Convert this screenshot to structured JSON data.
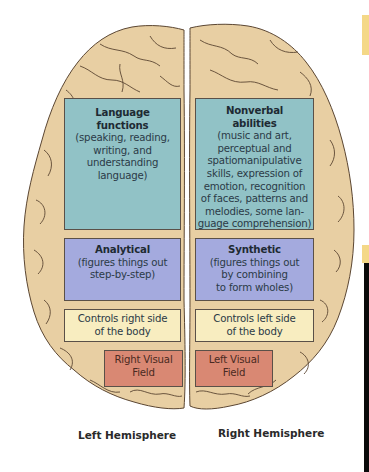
{
  "diagram": {
    "left_hemisphere": {
      "label": "Left Hemisphere",
      "regions": [
        {
          "title": "Language functions",
          "title_lines": [
            "Language",
            "functions"
          ],
          "body_lines": [
            "(speaking, reading,",
            "writing, and",
            "understanding",
            "language)"
          ],
          "color": "#91c2c6"
        },
        {
          "title": "Analytical",
          "body_lines": [
            "(figures things out",
            "step-by-step)"
          ],
          "color": "#a4aade"
        },
        {
          "body_lines": [
            "Controls right side",
            "of the body"
          ],
          "color": "#f8edc0"
        },
        {
          "body_lines": [
            "Right Visual",
            "Field"
          ],
          "color": "#d98873"
        }
      ]
    },
    "right_hemisphere": {
      "label": "Right Hemisphere",
      "regions": [
        {
          "title": "Nonverbal abilities",
          "title_lines": [
            "Nonverbal",
            "abilities"
          ],
          "body_lines": [
            "(music and art,",
            "perceptual and",
            "spatiomanipulative",
            "skills, expression of",
            "emotion, recognition",
            "of faces, patterns and",
            "melodies, some lan-",
            "guage comprehension)"
          ],
          "color": "#91c2c6"
        },
        {
          "title": "Synthetic",
          "body_lines": [
            "(figures things out",
            "by combining",
            "to form wholes)"
          ],
          "color": "#a4aade"
        },
        {
          "body_lines": [
            "Controls left side",
            "of the body"
          ],
          "color": "#f8edc0"
        },
        {
          "body_lines": [
            "Left Visual",
            "Field"
          ],
          "color": "#d98873"
        }
      ]
    },
    "colors": {
      "brain_fill": "#e8cfa3",
      "brain_stroke": "#5b4632",
      "edge_accent_yellow": "#f4d887",
      "edge_accent_black": "#0a0a0a"
    }
  }
}
